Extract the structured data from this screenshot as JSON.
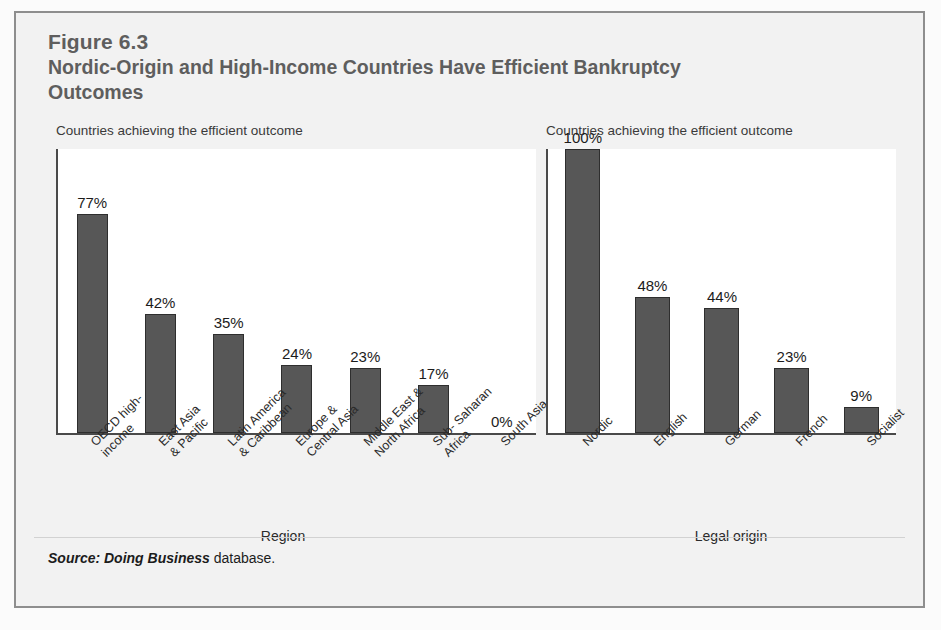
{
  "figure": {
    "number": "Figure 6.3",
    "title": "Nordic-Origin and High-Income Countries Have Efficient Bankruptcy Outcomes",
    "source_emphasis": "Source: Doing Business",
    "source_rest": " database."
  },
  "colors": {
    "bar_fill": "#575757",
    "bar_stroke": "#2e2e2e",
    "axis": "#4a4a4a",
    "title_text": "#5e5e5e",
    "frame": "#8e8e8e",
    "panel_bg": "#f2f2f2",
    "plot_bg": "#ffffff"
  },
  "chart_data": [
    {
      "type": "bar",
      "id": "by-region",
      "title": "Countries achieving the efficient outcome",
      "xlabel": "Region",
      "ylabel": "",
      "ylim": [
        0,
        100
      ],
      "grid": false,
      "legend": "none",
      "categories": [
        "OECD high-income",
        "East Asia & Pacific",
        "Latin America & Caribbean",
        "Europe & Central Asia",
        "Middle East & North Africa",
        "Sub- Saharan Africa",
        "South Asia"
      ],
      "category_lines": [
        [
          "OECD high-",
          "income"
        ],
        [
          "East Asia",
          "& Pacific"
        ],
        [
          "Latin America",
          "& Caribbean"
        ],
        [
          "Europe &",
          "Central Asia"
        ],
        [
          "Middle East &",
          "North Africa"
        ],
        [
          "Sub- Saharan",
          "Africa"
        ],
        [
          "South Asia"
        ]
      ],
      "values": [
        77,
        42,
        35,
        24,
        23,
        17,
        0
      ],
      "value_labels": [
        "77%",
        "42%",
        "35%",
        "24%",
        "23%",
        "17%",
        "0%"
      ]
    },
    {
      "type": "bar",
      "id": "by-legal-origin",
      "title": "Countries achieving the efficient outcome",
      "xlabel": "Legal origin",
      "ylabel": "",
      "ylim": [
        0,
        100
      ],
      "grid": false,
      "legend": "none",
      "categories": [
        "Nordic",
        "English",
        "German",
        "French",
        "Socialist"
      ],
      "category_lines": [
        [
          "Nordic"
        ],
        [
          "English"
        ],
        [
          "German"
        ],
        [
          "French"
        ],
        [
          "Socialist"
        ]
      ],
      "values": [
        100,
        48,
        44,
        23,
        9
      ],
      "value_labels": [
        "100%",
        "48%",
        "44%",
        "23%",
        "9%"
      ]
    }
  ]
}
